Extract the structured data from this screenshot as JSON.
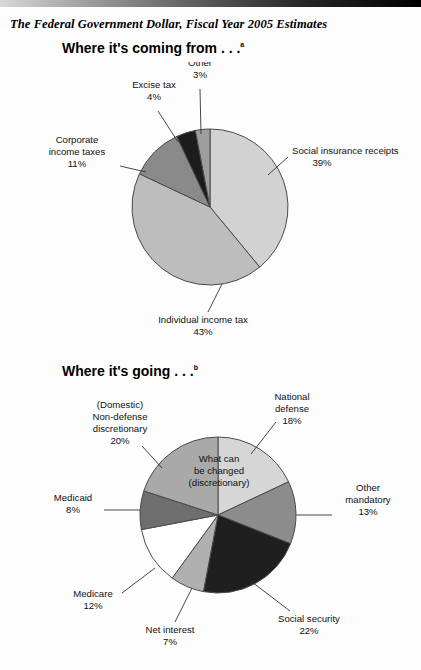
{
  "document": {
    "title": "The Federal Government Dollar, Fiscal Year 2005 Estimates"
  },
  "sections": [
    {
      "heading": "Where it's coming from . . .",
      "note": "a"
    },
    {
      "heading": "Where it's going . . .",
      "note": "b"
    }
  ],
  "annotations": {
    "discretionary_line1": "What can",
    "discretionary_line2": "be changed",
    "discretionary_line3": "(discretionary)"
  },
  "chart_data": [
    {
      "type": "pie",
      "title": "Where it's coming from . . .",
      "unit": "percent",
      "legend": "none",
      "labels_position": "outside-leader-lines",
      "categories": [
        "Social insurance receipts",
        "Individual income tax",
        "Corporate income taxes",
        "Excise tax",
        "Other"
      ],
      "values": [
        39,
        43,
        11,
        4,
        3
      ],
      "value_labels": [
        "39%",
        "43%",
        "11%",
        "4%",
        "3%"
      ],
      "colors": [
        "#d2d2d2",
        "#bdbdbd",
        "#8a8a8a",
        "#1c1c1c",
        "#9e9e9e"
      ],
      "label_lines": [
        [
          "Social insurance receipts",
          "39%"
        ],
        [
          "Individual income tax",
          "43%"
        ],
        [
          "Corporate",
          "income taxes",
          "11%"
        ],
        [
          "Excise tax",
          "4%"
        ],
        [
          "Other",
          "3%"
        ]
      ]
    },
    {
      "type": "pie",
      "title": "Where it's going . . .",
      "unit": "percent",
      "legend": "none",
      "labels_position": "outside-leader-lines",
      "categories": [
        "National defense",
        "Other mandatory",
        "Social security",
        "Net interest",
        "Medicare",
        "Medicaid",
        "(Domestic) Non-defense discretionary"
      ],
      "values": [
        18,
        13,
        22,
        7,
        12,
        8,
        20
      ],
      "value_labels": [
        "18%",
        "13%",
        "22%",
        "7%",
        "12%",
        "8%",
        "20%"
      ],
      "colors": [
        "#d6d6d6",
        "#8c8c8c",
        "#1f1f1f",
        "#b0b0b0",
        "#ffffff",
        "#6e6e6e",
        "#a9a9a9"
      ],
      "label_lines": [
        [
          "National",
          "defense",
          "18%"
        ],
        [
          "Other",
          "mandatory",
          "13%"
        ],
        [
          "Social security",
          "22%"
        ],
        [
          "Net interest",
          "7%"
        ],
        [
          "Medicare",
          "12%"
        ],
        [
          "Medicaid",
          "8%"
        ],
        [
          "(Domestic)",
          "Non-defense",
          "discretionary",
          "20%"
        ]
      ],
      "inner_annotation": [
        "What can",
        "be changed",
        "(discretionary)"
      ]
    }
  ]
}
